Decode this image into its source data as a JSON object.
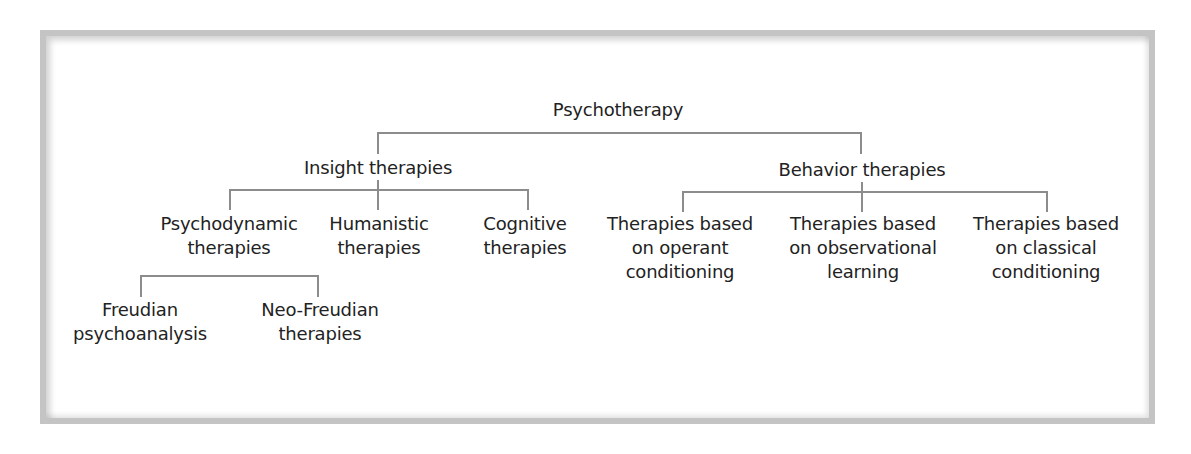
{
  "diagram": {
    "type": "tree",
    "root": {
      "label": "Psychotherapy",
      "lines": [
        "Psychotherapy"
      ]
    },
    "branches": [
      {
        "label": "Insight therapies",
        "lines": [
          "Insight therapies"
        ],
        "children": [
          {
            "label": "Psychodynamic therapies",
            "lines": [
              "Psychodynamic",
              "therapies"
            ],
            "children": [
              {
                "label": "Freudian psychoanalysis",
                "lines": [
                  "Freudian",
                  "psychoanalysis"
                ]
              },
              {
                "label": "Neo-Freudian therapies",
                "lines": [
                  "Neo-Freudian",
                  "therapies"
                ]
              }
            ]
          },
          {
            "label": "Humanistic therapies",
            "lines": [
              "Humanistic",
              "therapies"
            ]
          },
          {
            "label": "Cognitive therapies",
            "lines": [
              "Cognitive",
              "therapies"
            ]
          }
        ]
      },
      {
        "label": "Behavior therapies",
        "lines": [
          "Behavior therapies"
        ],
        "children": [
          {
            "label": "Therapies based on operant conditioning",
            "lines": [
              "Therapies based",
              "on operant",
              "conditioning"
            ]
          },
          {
            "label": "Therapies based on observational learning",
            "lines": [
              "Therapies based",
              "on observational",
              "learning"
            ]
          },
          {
            "label": "Therapies based on classical conditioning",
            "lines": [
              "Therapies based",
              "on classical",
              "conditioning"
            ]
          }
        ]
      }
    ]
  },
  "colors": {
    "text": "#222222",
    "connector": "#8c8c8c",
    "frame_border": "#c4c4c4",
    "background": "#ffffff"
  }
}
